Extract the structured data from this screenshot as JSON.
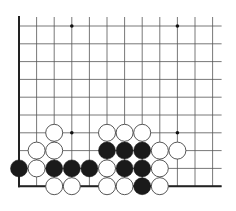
{
  "diagram": {
    "type": "go-board-partial",
    "grid": {
      "columns": 12,
      "rows": 10,
      "origin_x": 19,
      "origin_y": 26,
      "spacing_x": 17.6,
      "spacing_y": 17.8,
      "top_extend": 9,
      "right_extend": 9,
      "left_edge": true,
      "bottom_edge": true
    },
    "colors": {
      "background": "#ffffff",
      "line": "#555555",
      "edge": "#222222",
      "black_stone": "#1a1a1a",
      "white_stone": "#ffffff",
      "white_stroke": "#444444"
    },
    "star_points": [
      [
        3,
        0
      ],
      [
        9,
        0
      ],
      [
        3,
        6
      ],
      [
        9,
        6
      ]
    ],
    "stones": [
      {
        "col": 2,
        "row": 6,
        "color": "white"
      },
      {
        "col": 5,
        "row": 6,
        "color": "white"
      },
      {
        "col": 6,
        "row": 6,
        "color": "white"
      },
      {
        "col": 7,
        "row": 6,
        "color": "white"
      },
      {
        "col": 1,
        "row": 7,
        "color": "white"
      },
      {
        "col": 2,
        "row": 7,
        "color": "white"
      },
      {
        "col": 5,
        "row": 7,
        "color": "black"
      },
      {
        "col": 6,
        "row": 7,
        "color": "black"
      },
      {
        "col": 7,
        "row": 7,
        "color": "black"
      },
      {
        "col": 8,
        "row": 7,
        "color": "white"
      },
      {
        "col": 9,
        "row": 7,
        "color": "white"
      },
      {
        "col": 0,
        "row": 8,
        "color": "black"
      },
      {
        "col": 1,
        "row": 8,
        "color": "white"
      },
      {
        "col": 2,
        "row": 8,
        "color": "black"
      },
      {
        "col": 3,
        "row": 8,
        "color": "black"
      },
      {
        "col": 4,
        "row": 8,
        "color": "black"
      },
      {
        "col": 5,
        "row": 8,
        "color": "white"
      },
      {
        "col": 6,
        "row": 8,
        "color": "black"
      },
      {
        "col": 7,
        "row": 8,
        "color": "black"
      },
      {
        "col": 8,
        "row": 8,
        "color": "white"
      },
      {
        "col": 2,
        "row": 9,
        "color": "white"
      },
      {
        "col": 3,
        "row": 9,
        "color": "white"
      },
      {
        "col": 5,
        "row": 9,
        "color": "white"
      },
      {
        "col": 6,
        "row": 9,
        "color": "white"
      },
      {
        "col": 7,
        "row": 9,
        "color": "black"
      },
      {
        "col": 8,
        "row": 9,
        "color": "white"
      }
    ],
    "stone_counts": {
      "black": 11,
      "white": 15
    }
  }
}
